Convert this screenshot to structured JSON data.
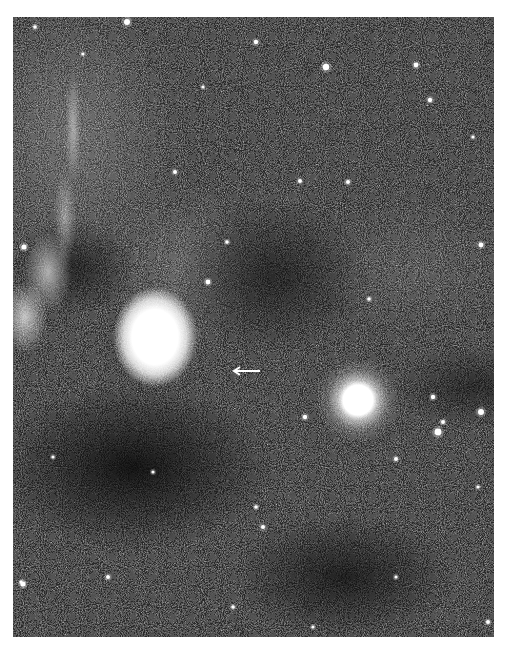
{
  "image": {
    "description": "Black-and-white astronomical photograph of a star field with a bright diffuse nebula, dust lanes, a bright foreground star, and a small arrow marker",
    "background_color": "#ffffff",
    "sky_color": "#2a2a2a",
    "nebula_color": "#ffffff",
    "features": {
      "bright_nebula": {
        "label": "bright diffuse nebula",
        "cx": 142,
        "cy": 320
      },
      "bright_star": {
        "label": "bright star",
        "cx": 345,
        "cy": 383
      },
      "filament": {
        "label": "bright filamentary nebulosity along left edge"
      },
      "arrow": {
        "label": "arrow marker pointing left",
        "x": 218,
        "y": 349
      }
    },
    "stars": [
      [
        114,
        5,
        3
      ],
      [
        313,
        50,
        3.2
      ],
      [
        243,
        25,
        2.2
      ],
      [
        403,
        48,
        2.4
      ],
      [
        417,
        83,
        2.2
      ],
      [
        335,
        165,
        2
      ],
      [
        162,
        155,
        2
      ],
      [
        195,
        265,
        2.4
      ],
      [
        292,
        400,
        2.2
      ],
      [
        287,
        164,
        2
      ],
      [
        468,
        228,
        2.4
      ],
      [
        468,
        395,
        3
      ],
      [
        425,
        415,
        3.4
      ],
      [
        430,
        405,
        2
      ],
      [
        420,
        380,
        2.2
      ],
      [
        383,
        442,
        2
      ],
      [
        250,
        510,
        2
      ],
      [
        243,
        490,
        1.8
      ],
      [
        11,
        230,
        2.6
      ],
      [
        10,
        567,
        2.6
      ],
      [
        475,
        605,
        2
      ],
      [
        95,
        560,
        2
      ],
      [
        22,
        10,
        1.8
      ],
      [
        214,
        225,
        1.8
      ],
      [
        356,
        282,
        1.8
      ],
      [
        140,
        455,
        1.6
      ],
      [
        220,
        590,
        1.8
      ],
      [
        383,
        560,
        1.6
      ],
      [
        465,
        470,
        1.6
      ],
      [
        40,
        440,
        1.6
      ],
      [
        8,
        565,
        1.6
      ],
      [
        300,
        610,
        1.6
      ],
      [
        190,
        70,
        1.6
      ],
      [
        460,
        120,
        1.6
      ],
      [
        70,
        37,
        1.6
      ]
    ]
  }
}
